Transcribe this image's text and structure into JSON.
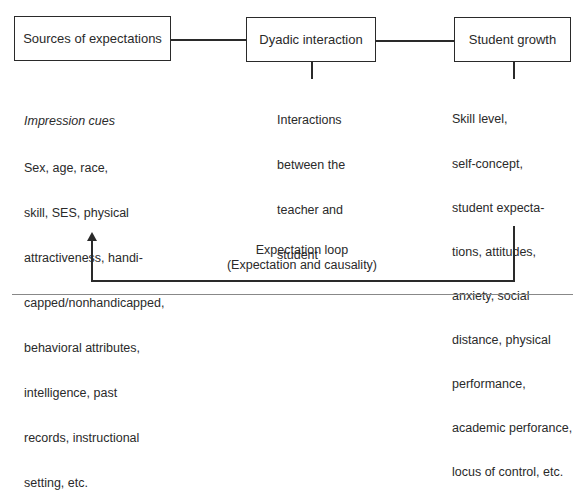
{
  "boxes": {
    "sources": {
      "label": "Sources of expectations"
    },
    "dyadic": {
      "label": "Dyadic interaction"
    },
    "growth": {
      "label": "Student growth"
    }
  },
  "sources_detail": {
    "heading": "Impression cues",
    "lines": [
      "Sex, age, race,",
      "skill, SES, physical",
      "attractiveness, handi-",
      "capped/nonhandicapped,",
      "behavioral attributes,",
      "intelligence, past",
      "records, instructional",
      "setting, etc."
    ]
  },
  "dyadic_detail": {
    "lines": [
      "Interactions",
      "between the",
      "teacher and",
      "student"
    ]
  },
  "growth_detail": {
    "lines": [
      "Skill level,",
      "self-concept,",
      "student expecta-",
      "tions, attitudes,",
      "anxiety, social",
      "distance, physical",
      "performance,",
      "academic perforance,",
      "locus of control, etc."
    ]
  },
  "loop": {
    "title": "Expectation loop",
    "subtitle": "(Expectation and causality)"
  }
}
